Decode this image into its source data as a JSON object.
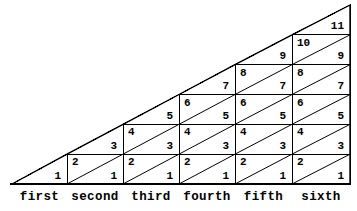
{
  "figure": {
    "colors": {
      "background": "#ffffff",
      "ink": "#000000"
    },
    "geometry": {
      "apex_x": 12,
      "right_x": 350,
      "baseline_y": 184,
      "top_y": 5,
      "row_height": 29.833,
      "column_edges": [
        12,
        67,
        123,
        179,
        235,
        292,
        350
      ]
    },
    "labels": [
      "first",
      "second",
      "third",
      "fourth",
      "fifth",
      "sixth"
    ],
    "columns": [
      {
        "index": 1,
        "label": "first",
        "cells": [
          {
            "row": 1,
            "lower": "1",
            "upper": null,
            "half": true
          }
        ]
      },
      {
        "index": 2,
        "label": "second",
        "cells": [
          {
            "row": 1,
            "lower": "1",
            "upper": "2",
            "half": false
          },
          {
            "row": 2,
            "lower": "3",
            "upper": null,
            "half": true
          }
        ]
      },
      {
        "index": 3,
        "label": "third",
        "cells": [
          {
            "row": 1,
            "lower": "1",
            "upper": "2",
            "half": false
          },
          {
            "row": 2,
            "lower": "3",
            "upper": "4",
            "half": false
          },
          {
            "row": 3,
            "lower": "5",
            "upper": null,
            "half": true
          }
        ]
      },
      {
        "index": 4,
        "label": "fourth",
        "cells": [
          {
            "row": 1,
            "lower": "1",
            "upper": "2",
            "half": false
          },
          {
            "row": 2,
            "lower": "3",
            "upper": "4",
            "half": false
          },
          {
            "row": 3,
            "lower": "5",
            "upper": "6",
            "half": false
          },
          {
            "row": 4,
            "lower": "7",
            "upper": null,
            "half": true
          }
        ]
      },
      {
        "index": 5,
        "label": "fifth",
        "cells": [
          {
            "row": 1,
            "lower": "1",
            "upper": "2",
            "half": false
          },
          {
            "row": 2,
            "lower": "3",
            "upper": "4",
            "half": false
          },
          {
            "row": 3,
            "lower": "5",
            "upper": "6",
            "half": false
          },
          {
            "row": 4,
            "lower": "7",
            "upper": "8",
            "half": false
          },
          {
            "row": 5,
            "lower": "9",
            "upper": null,
            "half": true
          }
        ]
      },
      {
        "index": 6,
        "label": "sixth",
        "cells": [
          {
            "row": 1,
            "lower": "1",
            "upper": "2",
            "half": false
          },
          {
            "row": 2,
            "lower": "3",
            "upper": "4",
            "half": false
          },
          {
            "row": 3,
            "lower": "5",
            "upper": "6",
            "half": false
          },
          {
            "row": 4,
            "lower": "7",
            "upper": "8",
            "half": false
          },
          {
            "row": 5,
            "lower": "9",
            "upper": "10",
            "half": false
          },
          {
            "row": 6,
            "lower": "11",
            "upper": null,
            "half": true
          }
        ]
      }
    ]
  }
}
